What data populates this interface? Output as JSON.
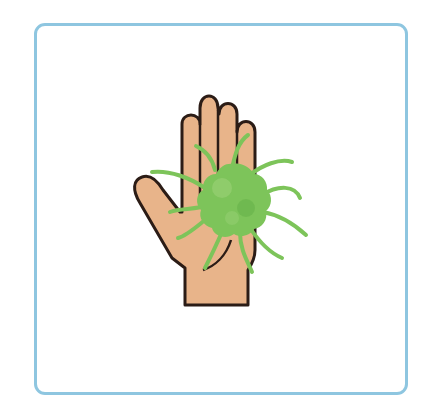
{
  "illustration": {
    "title": "Germ on hand",
    "alt": "A raised open hand with a green germ on the palm",
    "subjects": [
      "hand-icon",
      "germ-icon"
    ]
  },
  "colors": {
    "frame": "#8EC6E0",
    "background": "#FFFFFF",
    "skin": "#E8B48A",
    "outline": "#2B1C16",
    "germ": "#7DC45A",
    "germ_dark": "#5FAE45",
    "germ_light": "#9ED47A"
  }
}
